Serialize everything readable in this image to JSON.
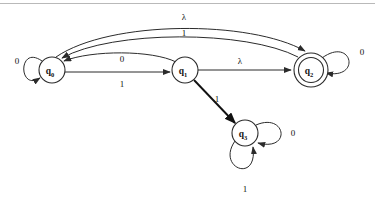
{
  "diagram": {
    "type": "state-machine",
    "alphabet_symbols": [
      "0",
      "1",
      "λ"
    ],
    "stroke_color": "#2b2b2b",
    "background_color": "#ffffff",
    "rule_color": "#b9b9b9"
  },
  "states": [
    {
      "id": "q0",
      "label": "q",
      "subscript": "0",
      "accepting": false,
      "x": 52,
      "y": 70,
      "r": 13
    },
    {
      "id": "q1",
      "label": "q",
      "subscript": "1",
      "accepting": false,
      "x": 185,
      "y": 70,
      "r": 13
    },
    {
      "id": "q2",
      "label": "q",
      "subscript": "2",
      "accepting": true,
      "x": 311,
      "y": 70,
      "r": 17,
      "inner_r": 12.5
    },
    {
      "id": "q3",
      "label": "q",
      "subscript": "3",
      "accepting": false,
      "x": 245,
      "y": 133,
      "r": 13
    }
  ],
  "transitions": [
    {
      "from": "q0",
      "to": "q0",
      "label": "0",
      "kind": "self-loop-left",
      "label_x": 17,
      "label_y": 64
    },
    {
      "from": "q0",
      "to": "q2",
      "label": "λ",
      "kind": "arc-high",
      "label_x": 184,
      "label_y": 20
    },
    {
      "from": "q2",
      "to": "q0",
      "label": "1",
      "kind": "arc-mid",
      "label_x": 184,
      "label_y": 36
    },
    {
      "from": "q1",
      "to": "q0",
      "label": "0",
      "kind": "arc-low",
      "label_x": 122,
      "label_y": 62
    },
    {
      "from": "q0",
      "to": "q1",
      "label": "1",
      "kind": "straight",
      "label_x": 122,
      "label_y": 87
    },
    {
      "from": "q1",
      "to": "q2",
      "label": "λ",
      "kind": "straight",
      "label_x": 240,
      "label_y": 64
    },
    {
      "from": "q1",
      "to": "q3",
      "label": "1",
      "kind": "straight-bold",
      "label_x": 217,
      "label_y": 102
    },
    {
      "from": "q3",
      "to": "q3",
      "label": "0",
      "kind": "self-loop-right",
      "label_x": 293,
      "label_y": 136
    },
    {
      "from": "q3",
      "to": "q3",
      "label": "1",
      "kind": "self-loop-below",
      "label_x": 245,
      "label_y": 192
    },
    {
      "from": "q2",
      "to": "q2",
      "label": "0",
      "kind": "self-loop-right",
      "label_x": 362,
      "label_y": 55
    }
  ]
}
